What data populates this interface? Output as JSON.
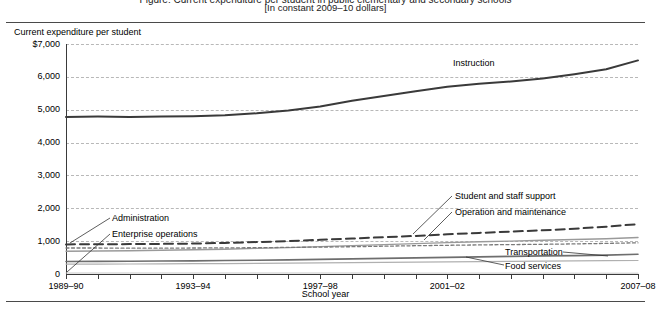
{
  "header": {
    "title_clipped": "Figure: Current expenditure per student in public elementary and secondary schools",
    "subtitle": "[In constant 2009–10 dollars]"
  },
  "axes": {
    "y_title": "Current expenditure per student",
    "x_title": "School year",
    "y_ticks": [
      "$7,000",
      "6,000",
      "5,000",
      "4,000",
      "3,000",
      "2,000",
      "1,000",
      "0"
    ],
    "x_ticks": [
      "1989–90",
      "1993–94",
      "1997–98",
      "2001–02",
      "2007–08"
    ]
  },
  "annotations": {
    "instruction": "Instruction",
    "administration": "Administration",
    "enterprise_operations": "Enterprise operations",
    "student_staff_support": "Student and staff support",
    "operation_maintenance": "Operation and maintenance",
    "transportation": "Transportation",
    "food_services": "Food services"
  },
  "chart_data": {
    "type": "line",
    "title": "Current expenditure per student in public elementary and secondary schools",
    "subtitle": "[In constant 2009–10 dollars]",
    "xlabel": "School year",
    "ylabel": "Current expenditure per student",
    "ylim": [
      0,
      7000
    ],
    "ytick_values": [
      0,
      1000,
      2000,
      3000,
      4000,
      5000,
      6000,
      7000
    ],
    "grid": true,
    "legend": "inline-annotations",
    "x": [
      "1989-90",
      "1990-91",
      "1991-92",
      "1992-93",
      "1993-94",
      "1994-95",
      "1995-96",
      "1996-97",
      "1997-98",
      "1998-99",
      "1999-00",
      "2000-01",
      "2001-02",
      "2002-03",
      "2003-04",
      "2004-05",
      "2005-06",
      "2006-07",
      "2007-08"
    ],
    "x_tick_labels": [
      "1989–90",
      "",
      "",
      "",
      "1993–94",
      "",
      "",
      "",
      "1997–98",
      "",
      "",
      "",
      "2001–02",
      "",
      "",
      "",
      "",
      "",
      "2007–08"
    ],
    "series": [
      {
        "name": "Instruction",
        "color": "#3a3a3a",
        "style": "solid",
        "width": 2.0,
        "values": [
          4780,
          4790,
          4780,
          4790,
          4800,
          4830,
          4890,
          4980,
          5100,
          5270,
          5420,
          5560,
          5700,
          5790,
          5860,
          5950,
          6080,
          6230,
          6500
        ]
      },
      {
        "name": "Administration",
        "color": "#3a3a3a",
        "style": "dashed",
        "width": 2.0,
        "values": [
          900,
          905,
          910,
          915,
          925,
          945,
          970,
          1000,
          1040,
          1080,
          1120,
          1160,
          1210,
          1250,
          1290,
          1330,
          1380,
          1440,
          1520
        ]
      },
      {
        "name": "Student and staff support",
        "color": "#9a9a9a",
        "style": "solid",
        "width": 1.4,
        "values": [
          690,
          700,
          710,
          720,
          735,
          755,
          780,
          805,
          835,
          865,
          895,
          925,
          955,
          980,
          1000,
          1025,
          1050,
          1075,
          1110
        ]
      },
      {
        "name": "Operation and maintenance",
        "color": "#7a7a7a",
        "style": "dashed-fine",
        "width": 1.3,
        "values": [
          790,
          790,
          785,
          785,
          790,
          795,
          800,
          810,
          820,
          830,
          845,
          860,
          875,
          885,
          895,
          905,
          915,
          930,
          950
        ]
      },
      {
        "name": "Transportation",
        "color": "#6e6e6e",
        "style": "solid",
        "width": 1.6,
        "values": [
          380,
          385,
          390,
          395,
          400,
          410,
          420,
          430,
          445,
          460,
          475,
          490,
          505,
          520,
          535,
          550,
          560,
          575,
          600
        ]
      },
      {
        "name": "Food services",
        "color": "#b0b0b0",
        "style": "solid",
        "width": 1.2,
        "values": [
          300,
          302,
          305,
          308,
          312,
          318,
          324,
          330,
          338,
          346,
          354,
          362,
          370,
          378,
          385,
          392,
          398,
          404,
          412
        ]
      },
      {
        "name": "Enterprise operations",
        "color": "#c8c8c8",
        "style": "solid",
        "width": 1.0,
        "values": [
          30,
          30,
          30,
          30,
          30,
          30,
          30,
          30,
          30,
          30,
          28,
          28,
          28,
          26,
          26,
          26,
          25,
          25,
          25
        ]
      }
    ]
  }
}
